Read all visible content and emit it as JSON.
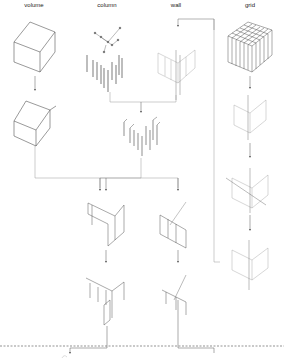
{
  "diagram": {
    "column_headers": [
      {
        "label": "volume",
        "x": 34
      },
      {
        "label": "column",
        "x": 107
      },
      {
        "label": "wall",
        "x": 176
      },
      {
        "label": "grid",
        "x": 250
      }
    ],
    "stroke_color": "#555555",
    "light_stroke_color": "#bbbbbb",
    "dashed_line_color": "#666666"
  }
}
